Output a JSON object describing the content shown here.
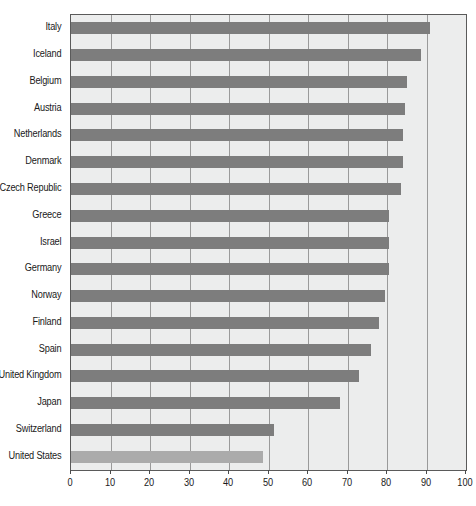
{
  "chart_data": {
    "type": "bar",
    "orientation": "horizontal",
    "title": "",
    "subtitle": "",
    "xlabel": "",
    "ylabel": "",
    "xlim": [
      0,
      100
    ],
    "xticks": [
      0,
      10,
      20,
      30,
      40,
      50,
      60,
      70,
      80,
      90,
      100
    ],
    "grid": true,
    "legend": "none",
    "categories": [
      "Italy",
      "Iceland",
      "Belgium",
      "Austria",
      "Netherlands",
      "Denmark",
      "Czech Republic",
      "Greece",
      "Israel",
      "Germany",
      "Norway",
      "Finland",
      "Spain",
      "United Kingdom",
      "Japan",
      "Switzerland",
      "United States"
    ],
    "values": [
      91,
      88.5,
      85,
      84.5,
      84,
      84,
      83.5,
      80.5,
      80.5,
      80.5,
      79.5,
      78,
      76,
      73,
      68,
      51.5,
      48.5
    ],
    "highlight_category": "United States",
    "colors": {
      "bar": "#7d7d7d",
      "bar_highlight": "#ababab",
      "plot_background": "#eceded",
      "gridline": "#9a9a9a",
      "axis": "#5a5a5a",
      "text": "#1a1a1a",
      "page_background": "#ffffff"
    }
  }
}
